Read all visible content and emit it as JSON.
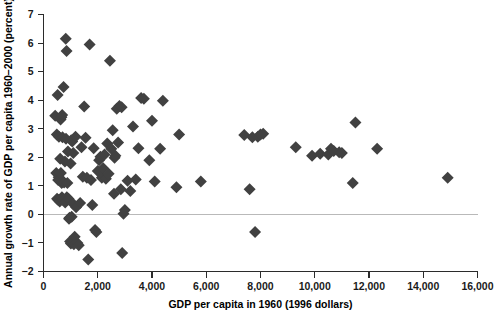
{
  "chart_data": {
    "type": "scatter",
    "title": "",
    "xlabel": "GDP per capita in 1960 (1996 dollars)",
    "ylabel": "Annual growth rate of GDP per capita 1960–2000 (percent)",
    "xlim": [
      0,
      16000
    ],
    "ylim": [
      -2,
      7
    ],
    "xticks": [
      0,
      2000,
      4000,
      6000,
      8000,
      10000,
      12000,
      14000,
      16000
    ],
    "xticklabels": [
      "0",
      "2,000",
      "4,000",
      "6,000",
      "8,000",
      "10,000",
      "12,000",
      "14,000",
      "16,000"
    ],
    "yticks": [
      -2,
      -1,
      0,
      1,
      2,
      3,
      4,
      5,
      6,
      7
    ],
    "yticklabels": [
      "−2",
      "−1",
      "0",
      "1",
      "2",
      "3",
      "4",
      "5",
      "6",
      "7"
    ],
    "grid": false,
    "legend": null,
    "marker": "diamond",
    "marker_color": "#414141",
    "marker_size": 6,
    "reference_lines": [
      {
        "axis": "y",
        "value": 0,
        "color": "#b9b9b9"
      }
    ],
    "series": [
      {
        "name": "Countries",
        "points": [
          [
            430,
            3.45
          ],
          [
            470,
            1.45
          ],
          [
            490,
            2.8
          ],
          [
            500,
            0.55
          ],
          [
            520,
            4.18
          ],
          [
            540,
            1.2
          ],
          [
            545,
            0.5
          ],
          [
            560,
            1.3
          ],
          [
            570,
            2.72
          ],
          [
            580,
            1.22
          ],
          [
            600,
            0.45
          ],
          [
            615,
            1.95
          ],
          [
            630,
            3.32
          ],
          [
            640,
            1.45
          ],
          [
            650,
            0.55
          ],
          [
            660,
            3.4
          ],
          [
            670,
            1.1
          ],
          [
            680,
            0.6
          ],
          [
            690,
            3.48
          ],
          [
            700,
            2.7
          ],
          [
            710,
            0.52
          ],
          [
            720,
            1.15
          ],
          [
            740,
            4.46
          ],
          [
            760,
            1.12
          ],
          [
            780,
            0.48
          ],
          [
            790,
            1.85
          ],
          [
            800,
            0.42
          ],
          [
            820,
            6.15
          ],
          [
            830,
            2.65
          ],
          [
            850,
            5.72
          ],
          [
            860,
            0.6
          ],
          [
            880,
            1.1
          ],
          [
            900,
            2.2
          ],
          [
            920,
            0.55
          ],
          [
            940,
            -0.15
          ],
          [
            960,
            -0.12
          ],
          [
            980,
            -0.95
          ],
          [
            1000,
            1.78
          ],
          [
            1010,
            -1.02
          ],
          [
            1020,
            2.6
          ],
          [
            1040,
            -0.08
          ],
          [
            1060,
            2.55
          ],
          [
            1080,
            0.38
          ],
          [
            1100,
            2.15
          ],
          [
            1120,
            -1.05
          ],
          [
            1150,
            -0.78
          ],
          [
            1180,
            2.72
          ],
          [
            1200,
            0.25
          ],
          [
            1250,
            -1.0
          ],
          [
            1300,
            -1.08
          ],
          [
            1350,
            0.4
          ],
          [
            1400,
            2.35
          ],
          [
            1450,
            1.32
          ],
          [
            1500,
            3.78
          ],
          [
            1550,
            2.68
          ],
          [
            1600,
            1.28
          ],
          [
            1650,
            -1.58
          ],
          [
            1700,
            5.95
          ],
          [
            1750,
            1.2
          ],
          [
            1800,
            0.33
          ],
          [
            1850,
            2.32
          ],
          [
            1900,
            -0.55
          ],
          [
            1950,
            -0.62
          ],
          [
            2000,
            1.52
          ],
          [
            2050,
            1.9
          ],
          [
            2100,
            2.02
          ],
          [
            2150,
            1.28
          ],
          [
            2200,
            1.62
          ],
          [
            2250,
            2.1
          ],
          [
            2300,
            1.25
          ],
          [
            2350,
            2.48
          ],
          [
            2400,
            1.42
          ],
          [
            2450,
            5.38
          ],
          [
            2500,
            2.3
          ],
          [
            2550,
            2.95
          ],
          [
            2600,
            0.72
          ],
          [
            2620,
            1.98
          ],
          [
            2650,
            2.05
          ],
          [
            2700,
            3.7
          ],
          [
            2750,
            2.52
          ],
          [
            2800,
            3.8
          ],
          [
            2850,
            0.88
          ],
          [
            2880,
            3.75
          ],
          [
            2900,
            -1.35
          ],
          [
            2950,
            0.02
          ],
          [
            3000,
            0.15
          ],
          [
            3100,
            1.18
          ],
          [
            3200,
            0.82
          ],
          [
            3300,
            3.08
          ],
          [
            3400,
            1.22
          ],
          [
            3500,
            2.32
          ],
          [
            3600,
            4.08
          ],
          [
            3700,
            4.05
          ],
          [
            3900,
            1.9
          ],
          [
            4000,
            3.28
          ],
          [
            4100,
            1.15
          ],
          [
            4300,
            2.3
          ],
          [
            4400,
            3.98
          ],
          [
            4900,
            0.95
          ],
          [
            5000,
            2.8
          ],
          [
            5800,
            1.15
          ],
          [
            7400,
            2.78
          ],
          [
            7600,
            0.88
          ],
          [
            7700,
            2.7
          ],
          [
            7800,
            -0.62
          ],
          [
            7900,
            2.72
          ],
          [
            8000,
            2.8
          ],
          [
            8100,
            2.82
          ],
          [
            9300,
            2.35
          ],
          [
            9900,
            2.05
          ],
          [
            10200,
            2.12
          ],
          [
            10500,
            2.1
          ],
          [
            10600,
            2.3
          ],
          [
            10700,
            2.22
          ],
          [
            10900,
            2.18
          ],
          [
            11000,
            2.15
          ],
          [
            11400,
            1.1
          ],
          [
            11500,
            3.22
          ],
          [
            12300,
            2.3
          ],
          [
            14900,
            1.28
          ]
        ]
      }
    ]
  }
}
